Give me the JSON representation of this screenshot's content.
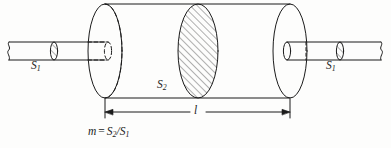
{
  "figure": {
    "type": "technical-line-drawing",
    "background_color": "#fdfdfc",
    "line_color": "#1b1b1b",
    "hatch_color": "#3a3a3a"
  },
  "labels": {
    "s1_left": {
      "symbol": "S",
      "subscript": "1"
    },
    "s1_right": {
      "symbol": "S",
      "subscript": "1"
    },
    "s2": {
      "symbol": "S",
      "subscript": "2"
    },
    "length": {
      "symbol": "l"
    },
    "equation": {
      "lhs": "m",
      "operator": "=",
      "numerator_symbol": "S",
      "numerator_subscript": "2",
      "slash": "/",
      "denominator_symbol": "S",
      "denominator_subscript": "1"
    }
  },
  "geometry": {
    "big_cylinder": {
      "left_cap_center_x": 105,
      "right_cap_center_x": 290,
      "cap_rx": 17,
      "cap_ry": 47,
      "top_y": 4,
      "bottom_y": 98
    },
    "mid_section_ellipse": {
      "center_x": 198,
      "rx": 20,
      "ry": 47,
      "hatched": true,
      "hatch_direction": "up-right"
    },
    "rod": {
      "axis_y": 51,
      "rx": 3,
      "ry": 9,
      "left_start_x": 9,
      "right_end_x": 381
    },
    "dimension_line": {
      "y": 112,
      "from_x": 105,
      "to_x": 290
    }
  }
}
